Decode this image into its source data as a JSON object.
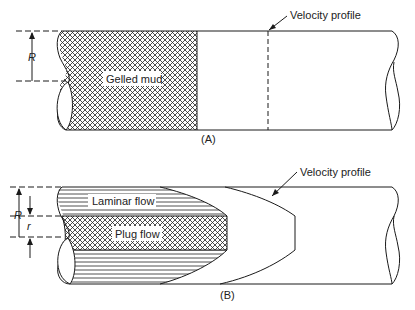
{
  "panel_a": {
    "caption": "(A)",
    "region_label": "Gelled mud",
    "velocity_label": "Velocity profile",
    "radius_label": "R"
  },
  "panel_b": {
    "caption": "(B)",
    "laminar_label": "Laminar flow",
    "plug_label": "Plug flow",
    "velocity_label": "Velocity profile",
    "radius_label": "R",
    "plug_radius_label": "r"
  },
  "colors": {
    "line": "#1a1a1a",
    "background": "#ffffff"
  }
}
